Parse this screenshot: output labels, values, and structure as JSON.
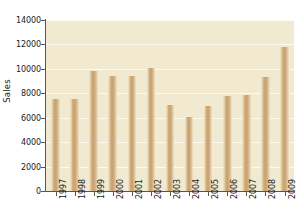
{
  "chart_data": {
    "type": "bar",
    "title": "",
    "xlabel": "",
    "ylabel": "Sales",
    "categories": [
      "1997",
      "1998",
      "1999",
      "2000",
      "2001",
      "2002",
      "2003",
      "2004",
      "2005",
      "2006",
      "2007",
      "2008",
      "2009"
    ],
    "values": [
      7500,
      7500,
      9800,
      9400,
      9400,
      10100,
      7050,
      6050,
      6950,
      7800,
      7900,
      9300,
      11800
    ],
    "ylim": [
      0,
      14000
    ],
    "yticks": [
      0,
      2000,
      4000,
      6000,
      8000,
      10000,
      12000,
      14000
    ],
    "ytick_labels": [
      "0",
      "2000",
      "4000",
      "6000",
      "8000",
      "10000",
      "12000",
      "14000"
    ],
    "grid": true,
    "grid_axis": "y",
    "legend": false,
    "colors": {
      "plot_background": "#f2ead0",
      "figure_background": "#ffffff",
      "bar_fill": "#c8a271",
      "bar_highlight": "#efe4c6",
      "gridline": "#fdfaf0",
      "axis": "#58564f",
      "text": "#1a1a1a"
    }
  }
}
